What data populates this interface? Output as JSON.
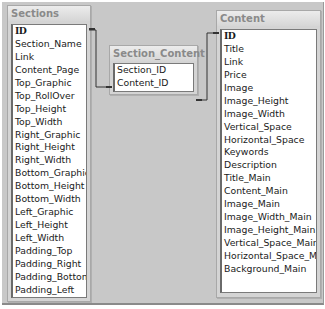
{
  "tables": {
    "sections": {
      "title": "Sections",
      "fields": [
        "ID",
        "Section_Name",
        "Link",
        "Content_Page",
        "Top_Graphic",
        "Top_RollOver",
        "Top_Height",
        "Top_Width",
        "Right_Graphic",
        "Right_Height",
        "Right_Width",
        "Bottom_Graphic",
        "Bottom_Height",
        "Bottom_Width",
        "Left_Graphic",
        "Left_Height",
        "Left_Width",
        "Padding_Top",
        "Padding_Right",
        "Padding_Bottom",
        "Padding_Left"
      ]
    },
    "section_content": {
      "title": "Section_Content",
      "fields": [
        "Section_ID",
        "Content_ID"
      ]
    },
    "content": {
      "title": "Content",
      "fields": [
        "ID",
        "Title",
        "Link",
        "Price",
        "Image",
        "Image_Height",
        "Image_Width",
        "Vertical_Space",
        "Horizontal_Space",
        "Keywords",
        "Description",
        "Title_Main",
        "Content_Main",
        "Image_Main",
        "Image_Width_Main",
        "Image_Height_Main",
        "Vertical_Space_Main",
        "Horizontal_Space_Main",
        "Background_Main"
      ]
    }
  },
  "relationships": [
    {
      "from": "Sections.ID",
      "to": "Section_Content.Section_ID"
    },
    {
      "from": "Section_Content.Content_ID",
      "to": "Content.ID"
    }
  ],
  "colors": {
    "canvas": "#c8c8c8",
    "title_text": "#8a8a8a",
    "line": "#333333"
  }
}
